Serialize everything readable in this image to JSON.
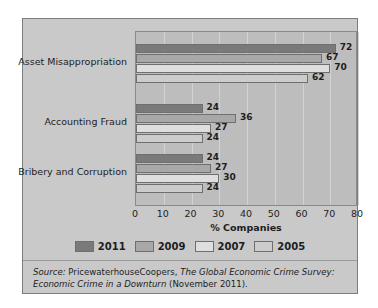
{
  "chart_data": {
    "type": "bar",
    "orientation": "horizontal",
    "title": "",
    "xlabel": "% Companies",
    "ylabel": "",
    "xlim": [
      0,
      80
    ],
    "xticks": [
      0,
      10,
      20,
      30,
      40,
      50,
      60,
      70,
      80
    ],
    "grid": true,
    "legend_position": "bottom",
    "categories": [
      "Asset Misappropriation",
      "Accounting Fraud",
      "Bribery and Corruption"
    ],
    "series": [
      {
        "name": "2011",
        "color": "#7a7a7a",
        "values": [
          72,
          24,
          24
        ]
      },
      {
        "name": "2009",
        "color": "#a8a8a8",
        "values": [
          67,
          36,
          27
        ]
      },
      {
        "name": "2007",
        "color": "#dedede",
        "values": [
          70,
          27,
          30
        ]
      },
      {
        "name": "2005",
        "color": "#cccccc",
        "values": [
          62,
          24,
          24
        ]
      }
    ],
    "data_labels": [
      [
        "72",
        "67",
        "70",
        "62"
      ],
      [
        "24",
        "36",
        "27",
        "24"
      ],
      [
        "24",
        "27",
        "30",
        "24"
      ]
    ]
  },
  "legend": {
    "items": [
      {
        "label": "2011",
        "color": "#7a7a7a"
      },
      {
        "label": "2009",
        "color": "#a8a8a8"
      },
      {
        "label": "2007",
        "color": "#dedede"
      },
      {
        "label": "2005",
        "color": "#cccccc"
      }
    ]
  },
  "axis": {
    "xlabel": "% Companies",
    "tick_labels": [
      "0",
      "10",
      "20",
      "30",
      "40",
      "50",
      "60",
      "70",
      "80"
    ]
  },
  "categories": [
    {
      "label": "Asset Misappropriation"
    },
    {
      "label": "Accounting Fraud"
    },
    {
      "label": "Bribery and Corruption"
    }
  ],
  "source": {
    "keyword": "Source:",
    "publisher": " PricewaterhouseCoopers, ",
    "title": "The Global Economic Crime Survey: Economic Crime in a Downturn",
    "suffix": " (November 2011)."
  }
}
